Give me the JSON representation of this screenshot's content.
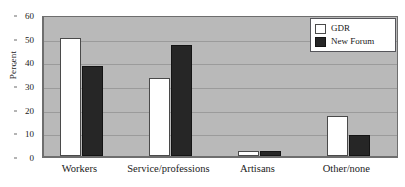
{
  "chart_data": {
    "type": "bar",
    "title": "",
    "subtitle": "",
    "xlabel": "",
    "ylabel": "Percent",
    "categories": [
      "Workers",
      "Service/professions",
      "Artisans",
      "Other/none"
    ],
    "series": [
      {
        "name": "GDR",
        "values": [
          50,
          33,
          2,
          17
        ],
        "color": "#ffffff"
      },
      {
        "name": "New Forum",
        "values": [
          38,
          47,
          2,
          9
        ],
        "color": "#262626"
      }
    ],
    "ylim": [
      0,
      60
    ],
    "yticks": [
      0,
      10,
      20,
      30,
      40,
      50,
      60
    ],
    "ytick_labels": [
      "0",
      "10",
      "20",
      "30",
      "40",
      "50",
      "60"
    ],
    "grid": "horizontal",
    "legend_position": "top-right",
    "plot_background": "#b9b9b9",
    "annotations": []
  }
}
